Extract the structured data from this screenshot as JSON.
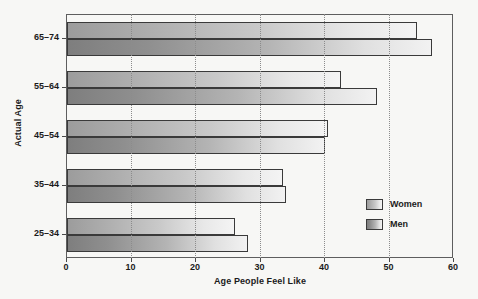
{
  "chart_data": {
    "type": "bar",
    "orientation": "horizontal",
    "title": "",
    "xlabel": "Age People Feel Like",
    "ylabel": "Actual Age",
    "categories": [
      "25–34",
      "35–44",
      "45–54",
      "55–64",
      "65–74"
    ],
    "series": [
      {
        "name": "Women",
        "values": [
          26,
          33.5,
          40.5,
          42.5,
          54.2
        ],
        "color": "#c2c2c2"
      },
      {
        "name": "Men",
        "values": [
          28,
          34,
          40,
          48,
          56.6
        ],
        "color": "#a8a8a8"
      }
    ],
    "xlim": [
      0,
      60
    ],
    "xticks": [
      0,
      10,
      20,
      30,
      40,
      50,
      60
    ],
    "xtick_labels": [
      "0",
      "10",
      "20",
      "30",
      "40",
      "50",
      "60"
    ],
    "grid": "vertical-dotted",
    "legend_position": "inside-right-lower",
    "legend_entries": [
      "Women",
      "Men"
    ]
  },
  "colors": {
    "background": "#f7f7f5",
    "axis": "#5e5e5e",
    "gridline": "#8c8c8c",
    "text": "#1b1b1b",
    "bar_outline": "#3a3a3a",
    "women_light": "#f4f4f4",
    "women_dark": "#9c9c9c",
    "men_light": "#f2f2f2",
    "men_dark": "#7e7e7e"
  }
}
